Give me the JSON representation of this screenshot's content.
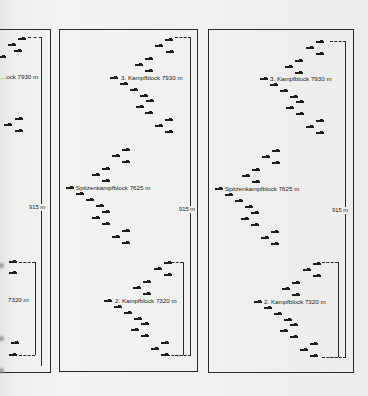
{
  "diagram": {
    "panels": [
      {
        "id": "panel-a",
        "partial": true,
        "labels": {
          "top": "…ock 7930 m",
          "bottom": "7320 m"
        },
        "distance": "915 m"
      },
      {
        "id": "panel-b",
        "labels": {
          "top": "3. Kampfblock 7930 m",
          "middle": "Spitzenkampfblock 7625 m",
          "bottom": "2. Kampfblock 7320 m"
        },
        "distance": "915 m"
      },
      {
        "id": "panel-c",
        "labels": {
          "top": "3. Kampfblock 7930 m",
          "middle": "Spitzenkampfblock 7625 m",
          "bottom": "2. Kampfblock 7320 m"
        },
        "distance": "915 m"
      }
    ],
    "formation_blocks": [
      {
        "name": "3. Kampfblock",
        "altitude": "7930 m"
      },
      {
        "name": "Spitzenkampfblock",
        "altitude": "7625 m"
      },
      {
        "name": "2. Kampfblock",
        "altitude": "7320 m"
      }
    ],
    "vertical_spacing": "915 m",
    "aircraft_per_block": 18
  }
}
